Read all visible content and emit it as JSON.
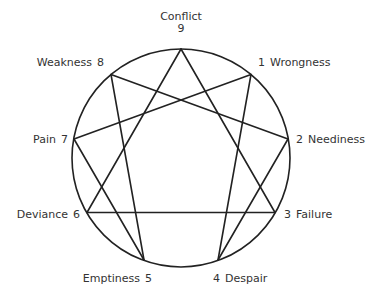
{
  "diagram": {
    "type": "enneagram",
    "circle": {
      "cx": 181,
      "cy": 158,
      "r": 109,
      "stroke": "#222222"
    },
    "line_color": "#222222",
    "text_color": "#333333",
    "points": [
      {
        "num": "9",
        "label": "Conflict",
        "x": 181,
        "y": 49
      },
      {
        "num": "1",
        "label": "Wrongness",
        "x": 251,
        "y": 74.5
      },
      {
        "num": "2",
        "label": "Neediness",
        "x": 288,
        "y": 139
      },
      {
        "num": "3",
        "label": "Failure",
        "x": 275,
        "y": 212.5
      },
      {
        "num": "4",
        "label": "Despair",
        "x": 218,
        "y": 260
      },
      {
        "num": "5",
        "label": "Emptiness",
        "x": 144,
        "y": 260
      },
      {
        "num": "6",
        "label": "Deviance",
        "x": 87,
        "y": 212.5
      },
      {
        "num": "7",
        "label": "Pain",
        "x": 74,
        "y": 139
      },
      {
        "num": "8",
        "label": "Weakness",
        "x": 111,
        "y": 74.5
      }
    ],
    "connections": [
      [
        "9",
        "3"
      ],
      [
        "3",
        "6"
      ],
      [
        "6",
        "9"
      ],
      [
        "1",
        "4"
      ],
      [
        "4",
        "2"
      ],
      [
        "2",
        "8"
      ],
      [
        "8",
        "5"
      ],
      [
        "5",
        "7"
      ],
      [
        "7",
        "1"
      ]
    ]
  },
  "labels": {
    "p9": {
      "name": "Conflict",
      "num": "9"
    },
    "p1": {
      "num": "1",
      "name": "Wrongness"
    },
    "p2": {
      "num": "2",
      "name": "Neediness"
    },
    "p3": {
      "num": "3",
      "name": "Failure"
    },
    "p4": {
      "num": "4",
      "name": "Despair"
    },
    "p5": {
      "name": "Emptiness",
      "num": "5"
    },
    "p6": {
      "name": "Deviance",
      "num": "6"
    },
    "p7": {
      "name": "Pain",
      "num": "7"
    },
    "p8": {
      "name": "Weakness",
      "num": "8"
    }
  }
}
